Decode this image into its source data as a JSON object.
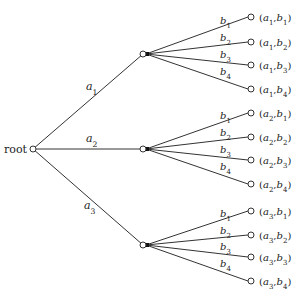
{
  "diagram": {
    "type": "tree",
    "root": {
      "label": "root",
      "x": 33,
      "y": 149
    },
    "first_level": [
      {
        "edge_label": "a",
        "edge_sub": "1",
        "x": 143,
        "y": 54,
        "label_x": 86,
        "label_y": 90
      },
      {
        "edge_label": "a",
        "edge_sub": "2",
        "x": 143,
        "y": 149,
        "label_x": 86,
        "label_y": 142
      },
      {
        "edge_label": "a",
        "edge_sub": "3",
        "x": 143,
        "y": 245,
        "label_x": 84,
        "label_y": 209
      }
    ],
    "branches": [
      {
        "a_sub": "1",
        "leaves_y": [
          17,
          42,
          65,
          89
        ]
      },
      {
        "a_sub": "2",
        "leaves_y": [
          113,
          137,
          160,
          184
        ]
      },
      {
        "a_sub": "3",
        "leaves_y": [
          211,
          235,
          257,
          281
        ]
      }
    ],
    "b_labels": [
      "1",
      "2",
      "3",
      "4"
    ],
    "leaf_x": 251,
    "colors": {
      "line": "#333333",
      "node_fill": "#ffffff",
      "text": "#222222"
    }
  }
}
